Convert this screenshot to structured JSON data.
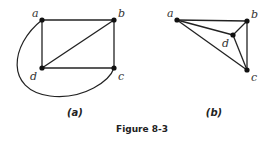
{
  "figure": {
    "caption": "Figure 8-3",
    "graphs": [
      {
        "id": "a",
        "sublabel": "(a)",
        "vertices": [
          {
            "name": "a",
            "x": 42,
            "y": 20,
            "lx": 32,
            "ly": 17
          },
          {
            "name": "b",
            "x": 114,
            "y": 20,
            "lx": 118,
            "ly": 17
          },
          {
            "name": "c",
            "x": 114,
            "y": 68,
            "lx": 118,
            "ly": 80
          },
          {
            "name": "d",
            "x": 42,
            "y": 68,
            "lx": 30,
            "ly": 80
          }
        ],
        "edges": [
          [
            "a",
            "b"
          ],
          [
            "a",
            "d"
          ],
          [
            "b",
            "c"
          ],
          [
            "d",
            "c"
          ],
          [
            "d",
            "b"
          ]
        ],
        "curved_edges": [
          {
            "from": "a",
            "to": "c",
            "path": "M42,20 C10,45 5,90 50,96 C85,100 110,80 114,68"
          }
        ]
      },
      {
        "id": "b",
        "sublabel": "(b)",
        "vertices": [
          {
            "name": "a",
            "x": 177,
            "y": 20,
            "lx": 167,
            "ly": 17
          },
          {
            "name": "b",
            "x": 247,
            "y": 21,
            "lx": 251,
            "ly": 18
          },
          {
            "name": "c",
            "x": 247,
            "y": 70,
            "lx": 251,
            "ly": 81
          },
          {
            "name": "d",
            "x": 233,
            "y": 35,
            "lx": 222,
            "ly": 47
          }
        ],
        "edges": [
          [
            "a",
            "b"
          ],
          [
            "a",
            "d"
          ],
          [
            "a",
            "c"
          ],
          [
            "b",
            "d"
          ],
          [
            "b",
            "c"
          ],
          [
            "d",
            "c"
          ]
        ],
        "curved_edges": []
      }
    ]
  }
}
